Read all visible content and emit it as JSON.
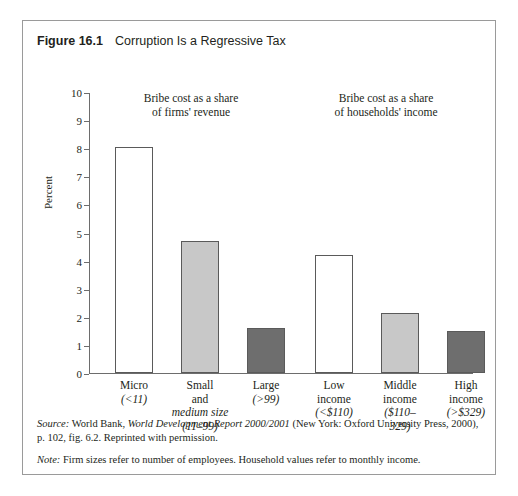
{
  "figure": {
    "label": "Figure 16.1",
    "title": "Corruption Is a Regressive Tax"
  },
  "notes": {
    "source_lead": "Source:",
    "source_text_1": " World Bank, ",
    "source_italic": "World Development Report 2000/2001",
    "source_text_2": " (New York: Oxford University Press, 2000), p. 102, fig. 6.2. Reprinted with permission.",
    "note_lead": "Note:",
    "note_text": " Firm sizes refer to number of employees. Household values refer to monthly income."
  },
  "colors": {
    "bar_white": "#ffffff",
    "bar_light_gray": "#c8c8c8",
    "bar_dark_gray": "#6e6e6e",
    "border": "#9a9a9a",
    "axis": "#6d6d6d",
    "text": "#231f20"
  },
  "chart_data": {
    "type": "bar",
    "title": "Corruption Is a Regressive Tax",
    "xlabel": "",
    "ylabel": "Percent",
    "ylim": [
      0,
      10
    ],
    "yticks": [
      0,
      1,
      2,
      3,
      4,
      5,
      6,
      7,
      8,
      9,
      10
    ],
    "ytick_labels": [
      "0",
      "1",
      "2",
      "3",
      "4",
      "5",
      "6",
      "7",
      "8",
      "9",
      "10"
    ],
    "grid": false,
    "legend": "none",
    "annotations": [
      {
        "id": "firms",
        "text": "Bribe cost as a share\nof firms' revenue",
        "group": "firms"
      },
      {
        "id": "households",
        "text": "Bribe cost as a share\nof households' income",
        "group": "households"
      }
    ],
    "groups": [
      {
        "name": "Bribe cost as a share of firms' revenue",
        "categories": [
          "Micro",
          "Small and medium size",
          "Large"
        ]
      },
      {
        "name": "Bribe cost as a share of households' income",
        "categories": [
          "Low income",
          "Middle income",
          "High income"
        ]
      }
    ],
    "categories": [
      "Micro (<11)",
      "Small and medium size (11-99)",
      "Large (>99)",
      "Low income (<$110)",
      "Middle income ($110-329)",
      "High income (>$329)"
    ],
    "values": [
      8.05,
      4.7,
      1.6,
      4.2,
      2.15,
      1.5
    ],
    "bars": [
      {
        "name": "Micro",
        "name_lines": "Micro",
        "sub_lines": "(<11)",
        "value": 8.05,
        "fill": "#ffffff",
        "group": "firms"
      },
      {
        "name": "Small and medium size",
        "name_lines": "Small\nand",
        "sub_lines": "medium size\n(11–99)",
        "value": 4.7,
        "fill": "#c8c8c8",
        "group": "firms"
      },
      {
        "name": "Large",
        "name_lines": "Large",
        "sub_lines": "(>99)",
        "value": 1.6,
        "fill": "#6e6e6e",
        "group": "firms"
      },
      {
        "name": "Low income",
        "name_lines": "Low\nincome",
        "sub_lines": "(<$110)",
        "value": 4.2,
        "fill": "#ffffff",
        "group": "households"
      },
      {
        "name": "Middle income",
        "name_lines": "Middle\nincome",
        "sub_lines": "($110–\n329)",
        "value": 2.15,
        "fill": "#c8c8c8",
        "group": "households"
      },
      {
        "name": "High income",
        "name_lines": "High\nincome",
        "sub_lines": "(>$329)",
        "value": 1.5,
        "fill": "#6e6e6e",
        "group": "households"
      }
    ]
  }
}
